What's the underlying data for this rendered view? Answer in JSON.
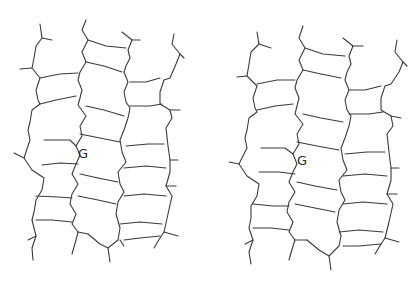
{
  "figure": {
    "type": "stereo-pair",
    "line_color": "#3a3a3a",
    "background": "#ffffff"
  },
  "panels": [
    {
      "name": "left",
      "label": "G"
    },
    {
      "name": "right",
      "label": "G"
    }
  ]
}
